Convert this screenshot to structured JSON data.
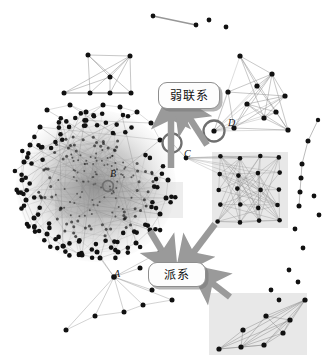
{
  "figure": {
    "type": "social-network-graph",
    "background_color": "#ffffff",
    "node_color": "#111111",
    "edge_color": "#8c8c8c",
    "highlight_box_color": "#e2e2e2",
    "arrow_color": "#9a9a9a",
    "callouts": [
      {
        "id": "weak-ties",
        "label": "弱联系",
        "x": 158,
        "y": 82,
        "w": 60,
        "h": 25
      },
      {
        "id": "clique",
        "label": "派系",
        "x": 148,
        "y": 262,
        "w": 56,
        "h": 23
      }
    ],
    "node_labels": [
      {
        "id": "A",
        "label": "A",
        "x": 114,
        "y": 270
      },
      {
        "id": "B",
        "label": "B",
        "x": 110,
        "y": 171
      },
      {
        "id": "C",
        "label": "C",
        "x": 184,
        "y": 150
      },
      {
        "id": "D",
        "label": "D",
        "x": 228,
        "y": 120
      }
    ],
    "circled_nodes": [
      {
        "id": "B",
        "cx": 108,
        "cy": 186,
        "r": 5.5
      },
      {
        "id": "C",
        "cx": 172,
        "cy": 143,
        "r": 10
      },
      {
        "id": "D",
        "cx": 215,
        "cy": 132,
        "r": 11
      }
    ],
    "highlight_boxes": [
      {
        "id": "clique-right",
        "x": 212,
        "y": 152,
        "w": 76,
        "h": 76
      },
      {
        "id": "clique-bottom",
        "x": 209,
        "y": 293,
        "w": 98,
        "h": 62
      },
      {
        "id": "clique-core-left",
        "x": 55,
        "y": 180,
        "w": 130,
        "h": 38
      }
    ],
    "arrows": [
      {
        "id": "weak-tie-arrow-vertical",
        "from_x": 171,
        "from_y": 168,
        "to_x": 171,
        "to_y": 110
      },
      {
        "id": "weak-tie-arrow-diagonal",
        "from_x": 208,
        "from_y": 146,
        "to_x": 185,
        "to_y": 111
      },
      {
        "id": "clique-arrow-upper-left",
        "from_x": 150,
        "from_y": 232,
        "to_x": 167,
        "to_y": 258
      },
      {
        "id": "clique-arrow-upper-right",
        "from_x": 214,
        "from_y": 226,
        "to_x": 188,
        "to_y": 258
      },
      {
        "id": "clique-arrow-lower-right",
        "from_x": 228,
        "from_y": 296,
        "to_x": 205,
        "to_y": 279
      }
    ]
  },
  "chart_data": {
    "type": "scatter",
    "title": "",
    "xlabel": "",
    "ylabel": "",
    "dense_core": {
      "center_x": 95,
      "center_y": 185,
      "radius_x": 82,
      "radius_y": 78,
      "node_count": 260,
      "edge_density": "very-high"
    },
    "cliques": [
      {
        "name": "top-left-square-clique",
        "nodes": 7
      },
      {
        "name": "top-right-clique",
        "nodes": 10
      },
      {
        "name": "right-highlighted-clique",
        "nodes": 16
      },
      {
        "name": "bottom-highlighted-clique",
        "nodes": 8
      },
      {
        "name": "bottom-left-fan",
        "nodes": 10
      }
    ],
    "isolated_nodes": 12,
    "bridge_nodes": [
      "C",
      "D"
    ],
    "legend_entries": [
      "弱联系",
      "派系"
    ]
  }
}
